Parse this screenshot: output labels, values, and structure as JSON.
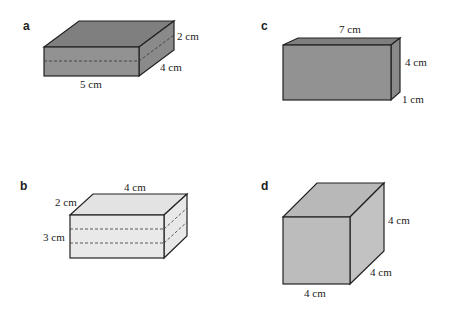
{
  "figures": [
    {
      "id": "a",
      "letter": "a",
      "fill_color": "#8f8f8f",
      "labels": {
        "height": "2 cm",
        "depth": "4 cm",
        "length": "5 cm"
      },
      "dashed_divisions": 1
    },
    {
      "id": "b",
      "letter": "b",
      "fill_color": "#e6e6e6",
      "labels": {
        "depth": "2 cm",
        "length": "4 cm",
        "height": "3 cm"
      },
      "dashed_divisions": 2
    },
    {
      "id": "c",
      "letter": "c",
      "fill_color": "#8f8f8f",
      "labels": {
        "length": "7 cm",
        "height": "4 cm",
        "depth": "1 cm"
      },
      "dashed_divisions": 0
    },
    {
      "id": "d",
      "letter": "d",
      "fill_color": "#bdbdbd",
      "labels": {
        "height": "4 cm",
        "depth": "4 cm",
        "length": "4 cm"
      },
      "dashed_divisions": 0
    }
  ]
}
